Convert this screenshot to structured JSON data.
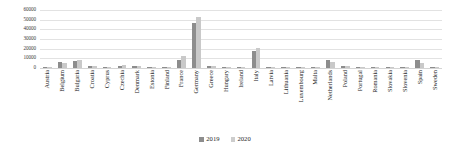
{
  "chart_data": {
    "type": "bar",
    "title": "",
    "xlabel": "",
    "ylabel": "",
    "ylim": [
      0,
      60000
    ],
    "yticks": [
      60000,
      50000,
      40000,
      30000,
      20000,
      10000,
      0
    ],
    "ytick_labels": [
      "60000",
      "50000",
      "40000",
      "30000",
      "20000",
      "10000",
      "0"
    ],
    "grid": true,
    "legend_position": "bottom",
    "categories": [
      "Austria",
      "Belgium",
      "Bulgaria",
      "Croatia",
      "Cyprus",
      "Czechia",
      "Denmark",
      "Estonia",
      "Finland",
      "France",
      "Germany",
      "Greece",
      "Hungary",
      "Ireland",
      "Italy",
      "Latvia",
      "Lithuania",
      "Luxembourg",
      "Malta",
      "Netherlands",
      "Poland",
      "Portugal",
      "Romania",
      "Slovakia",
      "Slovenia",
      "Spain",
      "Sweden"
    ],
    "series": [
      {
        "name": "2019",
        "color": "#8d8d8d",
        "values": [
          1200,
          6200,
          7600,
          2000,
          1500,
          2600,
          2400,
          900,
          700,
          8200,
          47000,
          2500,
          1400,
          600,
          18000,
          700,
          600,
          500,
          400,
          8000,
          2000,
          900,
          1200,
          600,
          500,
          8000,
          1400
        ]
      },
      {
        "name": "2020",
        "color": "#c9c9c9",
        "values": [
          900,
          5400,
          8500,
          1600,
          1100,
          3100,
          2100,
          700,
          500,
          12000,
          53000,
          2200,
          1100,
          500,
          21000,
          500,
          500,
          400,
          300,
          6000,
          1600,
          700,
          1000,
          500,
          400,
          5600,
          1000
        ]
      }
    ]
  },
  "legend": {
    "items": [
      {
        "label": "2019"
      },
      {
        "label": "2020"
      }
    ]
  }
}
